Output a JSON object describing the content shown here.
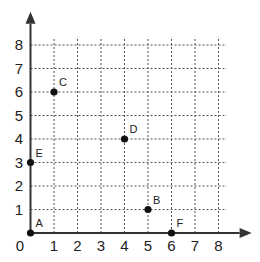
{
  "chart_data": {
    "type": "scatter",
    "title": "",
    "xlabel": "",
    "ylabel": "",
    "xlim": [
      0,
      8
    ],
    "ylim": [
      0,
      8
    ],
    "grid": true,
    "grid_style": "dashed",
    "x_ticks": [
      "0",
      "1",
      "2",
      "3",
      "4",
      "5",
      "6",
      "7",
      "8"
    ],
    "y_ticks": [
      "1",
      "2",
      "3",
      "4",
      "5",
      "6",
      "7",
      "8"
    ],
    "points": [
      {
        "label": "A",
        "x": 0,
        "y": 0
      },
      {
        "label": "B",
        "x": 5,
        "y": 1
      },
      {
        "label": "C",
        "x": 1,
        "y": 6
      },
      {
        "label": "D",
        "x": 4,
        "y": 4
      },
      {
        "label": "E",
        "x": 0,
        "y": 3
      },
      {
        "label": "F",
        "x": 6,
        "y": 0
      }
    ],
    "colors": {
      "axis": "#333333",
      "grid": "#555555",
      "point": "#111111"
    }
  }
}
